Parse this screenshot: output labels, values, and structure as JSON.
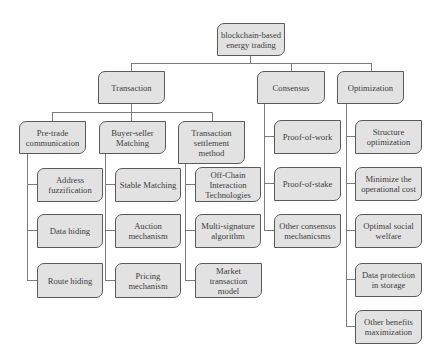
{
  "diagram": {
    "root": "blockchain-based\nenergy trading",
    "level1": {
      "transaction": "Transaction",
      "consensus": "Consensus",
      "optimization": "Optimization"
    },
    "transaction_children": {
      "pretrade": "Pre-trade\ncommunication",
      "buyer_seller": "Buyer-seller\nMatching",
      "settlement": "Transaction\nsettlement\nmethod"
    },
    "pretrade_items": [
      "Address\nfuzzification",
      "Data hiding",
      "Route hiding"
    ],
    "buyer_seller_items": [
      "Stable Matching",
      "Auction\nmechanism",
      "Pricing\nmechanism"
    ],
    "settlement_items": [
      "Off-Chain\nInteraction\nTechnologies",
      "Multi-signature\nalgorithm",
      "Market\ntransaction\nmodel"
    ],
    "consensus_items": [
      "Proof-of-work",
      "Proof-of-stake",
      "Other consensus\nmechanicsms"
    ],
    "optimization_items": [
      "Structure\noptimization",
      "Minimize the\noperational cost",
      "Optimal social\nwelfare",
      "Data protection\nin storage",
      "Other benefits\nmaximization"
    ],
    "colors": {
      "node_fill": "#e2e2e2",
      "node_border": "#5a5a5a",
      "text": "#3e3e3e",
      "connector": "#7a7a7a"
    }
  }
}
